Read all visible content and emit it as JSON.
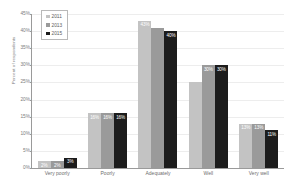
{
  "chart_data": {
    "type": "bar",
    "title": "",
    "xlabel": "",
    "ylabel": "Percent of respondents",
    "ylim": [
      0,
      45
    ],
    "ytick_labels": [
      "45%",
      "40%",
      "35%",
      "30%",
      "25%",
      "20%",
      "15%",
      "10%",
      "5%",
      "0%"
    ],
    "ytick_values": [
      45,
      40,
      35,
      30,
      25,
      20,
      15,
      10,
      5,
      0
    ],
    "grid": true,
    "legend_position": "top-left",
    "categories": [
      "Very poorly",
      "Poorly",
      "Adequately",
      "Well",
      "Very well"
    ],
    "series": [
      {
        "name": "2011",
        "color": "#c3c3c3",
        "values": [
          2,
          16,
          43,
          25,
          13
        ],
        "labels": [
          "2%",
          "16%",
          "43%",
          "",
          "13%"
        ]
      },
      {
        "name": "2013",
        "color": "#9a9a9a",
        "values": [
          2,
          16,
          41,
          30,
          13
        ],
        "labels": [
          "2%",
          "16%",
          "",
          "30%",
          "13%"
        ]
      },
      {
        "name": "2015",
        "color": "#1c1c1c",
        "values": [
          3,
          16,
          40,
          30,
          11
        ],
        "labels": [
          "3%",
          "16%",
          "40%",
          "30%",
          "11%"
        ]
      }
    ]
  }
}
